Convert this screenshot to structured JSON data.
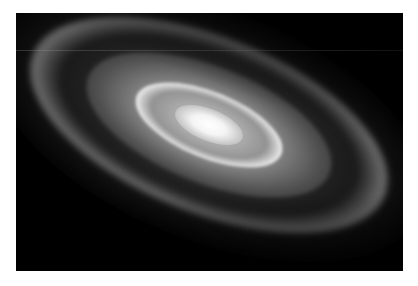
{
  "image": {
    "subject": "spiral galaxy",
    "description": "Grayscale photo of a tilted spiral galaxy with a bright central core and dusty spiral arms against a black background",
    "colors": {
      "background": "#000000",
      "core": "#ffffff",
      "page": "#ffffff"
    }
  }
}
